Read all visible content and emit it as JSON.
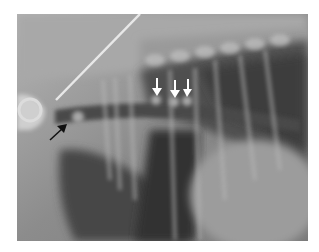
{
  "figure": {
    "type": "radiograph",
    "background_color": "#ffffff",
    "annotations": [
      {
        "id": "white-arrow-1",
        "color": "#ffffff",
        "direction": "down",
        "tip": [
          157,
          96
        ]
      },
      {
        "id": "white-arrow-2",
        "color": "#ffffff",
        "direction": "down",
        "tip": [
          175,
          98
        ]
      },
      {
        "id": "white-arrow-3",
        "color": "#ffffff",
        "direction": "down",
        "tip": [
          187,
          97
        ]
      },
      {
        "id": "black-arrow-1",
        "color": "#111111",
        "direction": "up-right",
        "tip": [
          67,
          124
        ]
      }
    ]
  }
}
